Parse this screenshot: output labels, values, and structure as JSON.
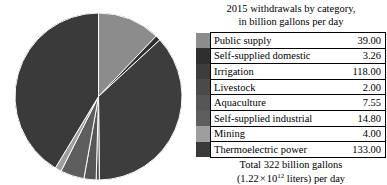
{
  "legend": {
    "title_line1": "2015 withdrawals by category,",
    "title_line2": "in billion gallons per day",
    "footer_line1": "Total 322 billion gallons",
    "footer_prefix": "(1.22",
    "footer_times": "×",
    "footer_base": "10",
    "footer_exponent": "12",
    "footer_suffix": "liters) per day",
    "rows": [
      {
        "label": "Public supply",
        "value": "39.00",
        "color": "#8c8c8c"
      },
      {
        "label": "Self-supplied domestic",
        "value": "3.26",
        "color": "#2f2f2f"
      },
      {
        "label": "Irrigation",
        "value": "118.00",
        "color": "#3d3d3d"
      },
      {
        "label": "Livestock",
        "value": "2.00",
        "color": "#4a4a4a"
      },
      {
        "label": "Aquaculture",
        "value": "7.55",
        "color": "#565656"
      },
      {
        "label": "Self-supplied industrial",
        "value": "14.80",
        "color": "#5e5e5e"
      },
      {
        "label": "Mining",
        "value": "4.00",
        "color": "#9e9e9e"
      },
      {
        "label": "Thermoelectric power",
        "value": "133.00",
        "color": "#3a3a3a"
      }
    ]
  },
  "chart_data": {
    "type": "pie",
    "title": "2015 withdrawals by category, in billion gallons per day",
    "unit": "billion gallons per day",
    "total": 322,
    "total_label": "Total 322 billion gallons (1.22 × 10^12 liters) per day",
    "start_angle_deg": 0,
    "direction": "clockwise",
    "legend_position": "right",
    "categories": [
      "Public supply",
      "Self-supplied domestic",
      "Irrigation",
      "Livestock",
      "Aquaculture",
      "Self-supplied industrial",
      "Mining",
      "Thermoelectric power"
    ],
    "values": [
      39.0,
      3.26,
      118.0,
      2.0,
      7.55,
      14.8,
      4.0,
      133.0
    ],
    "percents": [
      12.11,
      1.01,
      36.65,
      0.62,
      2.35,
      4.6,
      1.24,
      41.3
    ],
    "colors": [
      "#8c8c8c",
      "#2f2f2f",
      "#3d3d3d",
      "#4a4a4a",
      "#565656",
      "#5e5e5e",
      "#9e9e9e",
      "#3a3a3a"
    ],
    "slice_separator_color": "#ffffff",
    "center_x": 98.5,
    "center_y": 96.5,
    "radius": 83.5
  }
}
